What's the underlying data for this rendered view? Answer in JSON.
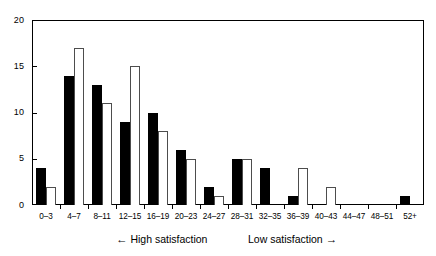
{
  "chart_data": {
    "type": "bar",
    "title": "",
    "subtitle": "",
    "xlabel": "",
    "ylabel": "",
    "ylim": [
      0,
      20
    ],
    "yticks": [
      0,
      5,
      10,
      15,
      20
    ],
    "ytick_labels": [
      "0",
      "5",
      "10",
      "15",
      "20"
    ],
    "grid": false,
    "legend_position": "none",
    "categories": [
      "0–3",
      "4–7",
      "8–11",
      "12–15",
      "16–19",
      "20–23",
      "24–27",
      "28–31",
      "32–35",
      "36–39",
      "40–43",
      "44–47",
      "48–51",
      "52+"
    ],
    "series": [
      {
        "name": "black",
        "style": "filled",
        "color": "#000000",
        "values": [
          4,
          14,
          13,
          9,
          10,
          6,
          2,
          5,
          4,
          1,
          0,
          0,
          0,
          1
        ]
      },
      {
        "name": "white",
        "style": "outlined",
        "color": "#ffffff",
        "edge_color": "#4d4d4d",
        "values": [
          2,
          17,
          11,
          15,
          8,
          5,
          1,
          5,
          0,
          4,
          2,
          0,
          0,
          0
        ]
      }
    ],
    "annotations": [
      {
        "id": "high-satisfaction",
        "text": "←  High satisfaction",
        "arrow": "left"
      },
      {
        "id": "low-satisfaction",
        "text": "Low satisfaction  →",
        "arrow": "right"
      }
    ]
  },
  "axis": {
    "y_ticks": [
      "20",
      "15",
      "10",
      "5",
      "0"
    ]
  },
  "captions": {
    "high_arrow": "←",
    "high_text": "High satisfaction",
    "low_text": "Low satisfaction",
    "low_arrow": "→"
  }
}
